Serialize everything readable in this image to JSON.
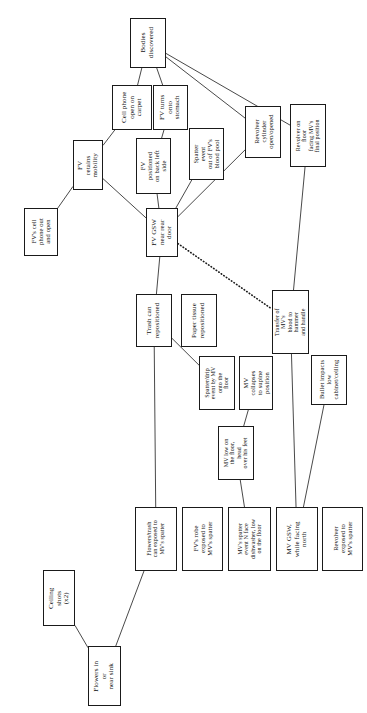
{
  "diagram": {
    "orientation": "text-rotated-90-ccw",
    "stroke_color": "#1a1a1a",
    "background_color": "#ffffff",
    "nodes": [
      {
        "id": "bodies_discovered",
        "label": "Bodies\ndiscovered",
        "x": 130,
        "y": 18,
        "w": 36,
        "h": 50
      },
      {
        "id": "cell_phone_carpet",
        "label": "Cell phone\nopen on\ncarpet",
        "x": 112,
        "y": 85,
        "w": 40,
        "h": 45
      },
      {
        "id": "fv_turns_stomach",
        "label": "FV turns\nonto\nstomach",
        "x": 153,
        "y": 85,
        "w": 35,
        "h": 45
      },
      {
        "id": "revolver_cylinder",
        "label": "Revolver\ncylinder\nopen/opened",
        "x": 245,
        "y": 106,
        "w": 36,
        "h": 52
      },
      {
        "id": "revolver_on_floor",
        "label": "Revolver on floor\nfacing MV's\nfinal position",
        "x": 290,
        "y": 104,
        "w": 36,
        "h": 63
      },
      {
        "id": "fv_retains_mobility",
        "label": "FV retains\nmobility",
        "x": 73,
        "y": 140,
        "w": 30,
        "h": 50
      },
      {
        "id": "fv_positioned_back",
        "label": "FV positioned\non back left\nside",
        "x": 136,
        "y": 138,
        "w": 35,
        "h": 56
      },
      {
        "id": "spatter_fv_blood_pool",
        "label": "Spatter event\nout of FV's\nblood pool",
        "x": 189,
        "y": 128,
        "w": 35,
        "h": 52
      },
      {
        "id": "fv_cell_phone_out",
        "label": "FV's cell\nphone out\nand open",
        "x": 24,
        "y": 208,
        "w": 34,
        "h": 48
      },
      {
        "id": "fv_gsw_rear_door",
        "label": "FV GSW\nnear rear\ndoor",
        "x": 146,
        "y": 208,
        "w": 32,
        "h": 49
      },
      {
        "id": "trash_can_repositioned",
        "label": "Trash can\nrepositioned",
        "x": 136,
        "y": 294,
        "w": 36,
        "h": 53
      },
      {
        "id": "paper_tissue_repos",
        "label": "Paper tissue\nrepositioned",
        "x": 181,
        "y": 294,
        "w": 36,
        "h": 53
      },
      {
        "id": "transfer_mv_blood",
        "label": "Transfer of MV's\nblood to hammer\nand handle",
        "x": 272,
        "y": 290,
        "w": 37,
        "h": 64
      },
      {
        "id": "spatter_drip_mv",
        "label": "Spatter/drip\nevent by MV\nonto the floor",
        "x": 199,
        "y": 356,
        "w": 36,
        "h": 54
      },
      {
        "id": "mv_collapses_supine",
        "label": "MV collapses\nto supine\nposition",
        "x": 239,
        "y": 356,
        "w": 34,
        "h": 54
      },
      {
        "id": "bullet_impacts",
        "label": "Bullet impacts\nlow\ncabinet/ceiling",
        "x": 311,
        "y": 355,
        "w": 36,
        "h": 50
      },
      {
        "id": "mv_low_on_floor",
        "label": "MV low on\nthe floor, head\nover his feet",
        "x": 218,
        "y": 426,
        "w": 36,
        "h": 54
      },
      {
        "id": "ceiling_shots",
        "label": "Ceiling shots\n(x2)",
        "x": 43,
        "y": 570,
        "w": 32,
        "h": 56
      },
      {
        "id": "flowers_trash_can",
        "label": "Flowers/trash\ncan exposed to\nMV's spatter",
        "x": 135,
        "y": 507,
        "w": 42,
        "h": 64
      },
      {
        "id": "fv_robe_spatter",
        "label": "FV's robe\nexposed to\nMV's spatter",
        "x": 182,
        "y": 507,
        "w": 41,
        "h": 64
      },
      {
        "id": "mv_spatter_dishwasher",
        "label": "MV's spatter\nevent N face\ndishwasher, low\non the floor",
        "x": 228,
        "y": 507,
        "w": 43,
        "h": 64
      },
      {
        "id": "mv_gsw_facing_north",
        "label": "MV GSW,\nwhile facing\nnorth",
        "x": 276,
        "y": 507,
        "w": 42,
        "h": 64
      },
      {
        "id": "revolver_exposed",
        "label": "Revolver\nexposed to\nMV's spatter",
        "x": 322,
        "y": 507,
        "w": 41,
        "h": 64
      },
      {
        "id": "flowers_near_sink",
        "label": "Flowers in or\nnear sink",
        "x": 88,
        "y": 646,
        "w": 33,
        "h": 60
      }
    ],
    "edges": [
      {
        "from": "bodies_discovered",
        "to": "cell_phone_carpet",
        "style": "solid"
      },
      {
        "from": "bodies_discovered",
        "to": "fv_turns_stomach",
        "style": "solid"
      },
      {
        "from": "bodies_discovered",
        "to": "revolver_cylinder",
        "style": "solid"
      },
      {
        "from": "bodies_discovered",
        "to": "revolver_on_floor",
        "style": "solid"
      },
      {
        "from": "cell_phone_carpet",
        "to": "fv_retains_mobility",
        "style": "solid"
      },
      {
        "from": "fv_turns_stomach",
        "to": "fv_positioned_back",
        "style": "solid"
      },
      {
        "from": "fv_retains_mobility",
        "to": "fv_cell_phone_out",
        "style": "solid"
      },
      {
        "from": "fv_retains_mobility",
        "to": "fv_gsw_rear_door",
        "style": "solid"
      },
      {
        "from": "fv_positioned_back",
        "to": "fv_gsw_rear_door",
        "style": "solid"
      },
      {
        "from": "spatter_fv_blood_pool",
        "to": "fv_gsw_rear_door",
        "style": "solid"
      },
      {
        "from": "revolver_cylinder",
        "to": "fv_gsw_rear_door",
        "style": "solid"
      },
      {
        "from": "fv_gsw_rear_door",
        "to": "trash_can_repositioned",
        "style": "solid"
      },
      {
        "from": "fv_gsw_rear_door",
        "to": "transfer_mv_blood",
        "style": "dotted"
      },
      {
        "from": "revolver_on_floor",
        "to": "transfer_mv_blood",
        "style": "solid"
      },
      {
        "from": "trash_can_repositioned",
        "to": "spatter_drip_mv",
        "style": "solid"
      },
      {
        "from": "trash_can_repositioned",
        "to": "flowers_trash_can",
        "style": "solid"
      },
      {
        "from": "mv_collapses_supine",
        "to": "mv_low_on_floor",
        "style": "solid"
      },
      {
        "from": "mv_low_on_floor",
        "to": "mv_spatter_dishwasher",
        "style": "solid"
      },
      {
        "from": "transfer_mv_blood",
        "to": "mv_gsw_facing_north",
        "style": "solid"
      },
      {
        "from": "bullet_impacts",
        "to": "mv_gsw_facing_north",
        "style": "solid"
      },
      {
        "from": "ceiling_shots",
        "to": "flowers_near_sink",
        "style": "solid"
      },
      {
        "from": "flowers_near_sink",
        "to": "flowers_trash_can",
        "style": "solid"
      }
    ]
  }
}
